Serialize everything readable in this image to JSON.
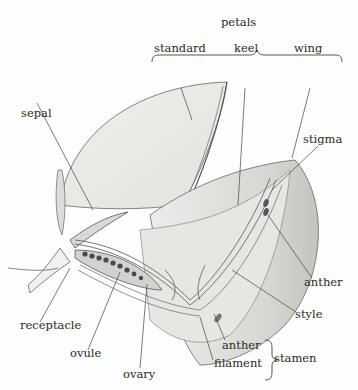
{
  "diagram": {
    "group_labels": {
      "petals": "petals",
      "stamen": "stamen"
    },
    "labels": {
      "standard": "standard",
      "keel": "keel",
      "wing": "wing",
      "sepal": "sepal",
      "stigma": "stigma",
      "anther_upper": "anther",
      "style": "style",
      "receptacle": "receptacle",
      "ovule": "ovule",
      "ovary": "ovary",
      "anther_lower": "anther",
      "filament": "filament"
    },
    "colors": {
      "background": "#fdfdfc",
      "petal_fill": "#e9e9e6",
      "petal_shade": "#cfcfcb",
      "outline": "#555555",
      "ovule_fill": "#4a4a4a",
      "text": "#2a2a2a"
    }
  }
}
